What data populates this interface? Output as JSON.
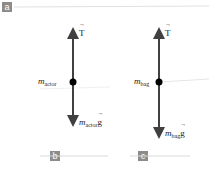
{
  "panels": {
    "a": {
      "label": "a"
    },
    "b": {
      "label": "b"
    },
    "c": {
      "label": "c"
    }
  },
  "diagram_actor": {
    "mass_symbol": "m",
    "mass_subscript": "actor",
    "up_force": "T",
    "down_force_mass": "m",
    "down_force_subscript": "actor",
    "down_force_g": "g"
  },
  "diagram_bag": {
    "mass_symbol": "m",
    "mass_subscript": "bag",
    "up_force": "T",
    "down_force_mass": "m",
    "down_force_subscript": "bag",
    "down_force_g": "g"
  },
  "colors": {
    "arrow": "#404040",
    "dot": "#000000",
    "label_bg": "#8c8c8c",
    "rule": "#d9d9d9"
  }
}
